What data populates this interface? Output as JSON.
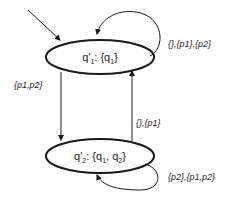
{
  "diagram": {
    "type": "state-machine",
    "colors": {
      "stroke": "#1a1a1a",
      "background": "#ffffff"
    },
    "states": [
      {
        "id": "q1p",
        "label_main": "q'",
        "label_sub": "1",
        "label_rest": ": {q",
        "label_rest_sub": "1",
        "label_end": "}",
        "initial": true
      },
      {
        "id": "q2p",
        "label_main": "q'",
        "label_sub": "2",
        "label_rest": ": {q",
        "label_rest_sub": "1",
        "label_mid": ", q",
        "label_mid_sub": "2",
        "label_end": "}",
        "initial": false
      }
    ],
    "transitions": [
      {
        "from": "q1p",
        "to": "q1p",
        "label": "{},{p1},{p2}"
      },
      {
        "from": "q1p",
        "to": "q2p",
        "label": "{p1,p2}"
      },
      {
        "from": "q2p",
        "to": "q1p",
        "label": "{},{p1}"
      },
      {
        "from": "q2p",
        "to": "q2p",
        "label": "{p2},{p1,p2}"
      }
    ]
  }
}
